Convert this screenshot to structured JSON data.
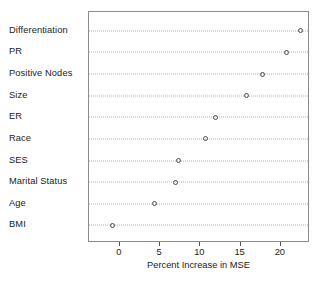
{
  "chart_data": {
    "type": "scatter",
    "subtype": "dot-plot",
    "title": "",
    "xlabel": "Percent Increase in MSE",
    "ylabel": "",
    "categories": [
      "Differentiation",
      "PR",
      "Positive Nodes",
      "Size",
      "ER",
      "Race",
      "SES",
      "Marital Status",
      "Age",
      "BMI"
    ],
    "values": [
      22.6,
      20.8,
      17.9,
      15.9,
      12.0,
      10.8,
      7.4,
      7.1,
      4.4,
      -0.8
    ],
    "series": [
      {
        "name": "Percent Increase in MSE",
        "values": [
          22.6,
          20.8,
          17.9,
          15.9,
          12.0,
          10.8,
          7.4,
          7.1,
          4.4,
          -0.8
        ]
      }
    ],
    "xticks": [
      0,
      5,
      10,
      15,
      20
    ],
    "xticklabels": [
      "0",
      "5",
      "10",
      "15",
      "20"
    ],
    "xlim": [
      -3.7,
      23.5
    ],
    "grid": "horizontal-dotted",
    "legend": "none",
    "marker": "open-circle",
    "colors": {
      "marker_stroke": "#4d4d4d",
      "grid": "#b4b4b4",
      "panel_border": "#8c8c8c",
      "text": "#1a1a1a",
      "background": "#ffffff"
    }
  },
  "caption": {
    "text": ""
  }
}
